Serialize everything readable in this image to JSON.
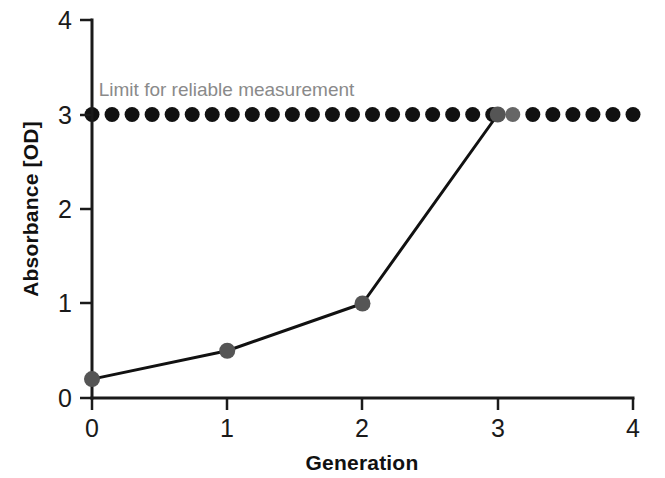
{
  "chart_data": {
    "type": "line",
    "title": "",
    "xlabel": "Generation",
    "ylabel": "Absorbance [OD]",
    "xlim": [
      0,
      4
    ],
    "ylim": [
      0,
      4
    ],
    "xticks": [
      "0",
      "1",
      "2",
      "3",
      "4"
    ],
    "yticks": [
      "0",
      "1",
      "2",
      "3",
      "4"
    ],
    "grid": false,
    "legend": "none",
    "series": [
      {
        "name": "Absorbance",
        "x": [
          0,
          1,
          2,
          3
        ],
        "values": [
          0.2,
          0.5,
          1.0,
          3.0
        ],
        "marker_color": "#555555",
        "line_color": "#111111"
      },
      {
        "name": "Limit for reliable measurement",
        "type": "dotted-threshold",
        "y": 3.0,
        "x_start": 0,
        "x_end": 4,
        "dot_count": 28,
        "dot_color": "#111111",
        "highlight_index": 21,
        "highlight_color": "#666666"
      }
    ],
    "annotations": [
      {
        "text": "Limit for reliable measurement",
        "x": 0.05,
        "y": 3.2,
        "color": "#8a8a8a"
      }
    ]
  },
  "axes": {
    "x_title": "Generation",
    "y_title": "Absorbance [OD]",
    "x_tick_labels": [
      "0",
      "1",
      "2",
      "3",
      "4"
    ],
    "y_tick_labels": [
      "0",
      "1",
      "2",
      "3",
      "4"
    ]
  },
  "annotation": {
    "limit_label": "Limit for reliable measurement"
  },
  "colors": {
    "axis": "#1a1a1a",
    "line": "#111111",
    "marker": "#555555",
    "dot": "#111111",
    "dot_highlight": "#666666",
    "annotation": "#8a8a8a",
    "background": "#ffffff"
  }
}
